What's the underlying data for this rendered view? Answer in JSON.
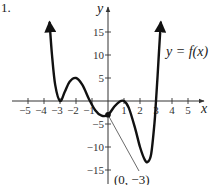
{
  "problem_number": "1.",
  "chart_data": {
    "type": "line",
    "title": "",
    "xlabel": "x",
    "ylabel": "y",
    "curve_label": "y = f(x)",
    "xlim": [
      -5.5,
      5.8
    ],
    "ylim": [
      -17,
      19
    ],
    "grid": false,
    "legend": "none",
    "x_ticks": [
      -5,
      -4,
      -3,
      -2,
      -1,
      1,
      2,
      3,
      4,
      5
    ],
    "x_tick_labels": [
      "−5",
      "−4",
      "−3",
      "−2",
      "−1",
      "1",
      "2",
      "3",
      "4",
      "5"
    ],
    "y_ticks": [
      -15,
      -10,
      -5,
      5,
      10,
      15
    ],
    "y_tick_labels": [
      "−15",
      "−10",
      "−5",
      "5",
      "10",
      "15"
    ],
    "series": [
      {
        "name": "f(x)",
        "x": [
          -3.65,
          -3.5,
          -3.3,
          -3.0,
          -2.7,
          -2.4,
          -2.0,
          -1.6,
          -1.2,
          -0.8,
          -0.4,
          0.0,
          0.4,
          0.7,
          1.0,
          1.3,
          1.7,
          2.0,
          2.3,
          2.5,
          2.7,
          2.9,
          3.0,
          3.1,
          3.2,
          3.3
        ],
        "y": [
          17.0,
          10.0,
          3.5,
          0.0,
          2.0,
          4.2,
          5.0,
          3.5,
          0.5,
          -2.0,
          -3.2,
          -3.0,
          -1.2,
          -0.2,
          0.0,
          -1.5,
          -6.0,
          -10.0,
          -12.8,
          -13.2,
          -11.5,
          -5.0,
          0.0,
          5.5,
          11.5,
          17.0
        ],
        "arrows": [
          "start",
          "end"
        ]
      }
    ],
    "annotations": [
      {
        "label": "(0, −3)",
        "point": [
          0,
          -3
        ],
        "marked": true,
        "leader_line": true
      }
    ],
    "key_points": {
      "local_min_touching_axis": [
        -3,
        0
      ],
      "local_max": [
        -2,
        5
      ],
      "y_intercept": [
        0,
        -3
      ],
      "local_max_touching_axis": [
        1,
        0
      ],
      "local_min": [
        2.5,
        -13
      ],
      "x_intercept": [
        3,
        0
      ]
    }
  },
  "labels": {
    "x_axis": "x",
    "y_axis": "y",
    "curve": "y = f(x)",
    "point": "(0, −3)"
  }
}
